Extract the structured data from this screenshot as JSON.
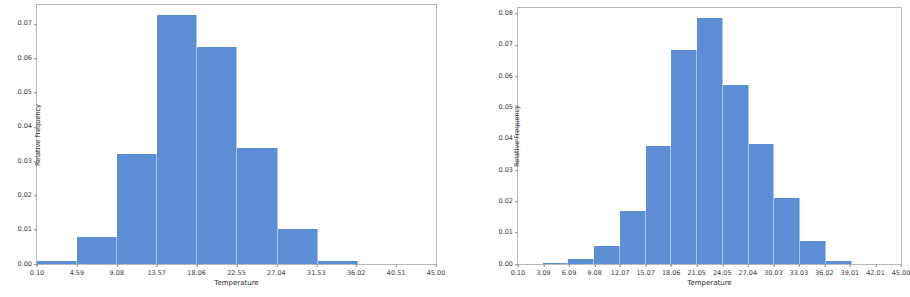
{
  "figure": {
    "background_color": "#ffffff",
    "bar_color": "#5b8ed4",
    "bar_edge_color": "#a8c4e8",
    "axis_color": "#b9b9b9"
  },
  "chart_data": [
    {
      "type": "bar",
      "title": "",
      "xlabel": "Temperature",
      "ylabel": "Relative Frequency",
      "xlim": [
        0.1,
        45.0
      ],
      "ylim": [
        0.0,
        0.0755
      ],
      "grid": false,
      "legend": null,
      "xticks": [
        "0.10",
        "4.59",
        "9.08",
        "13.57",
        "18.06",
        "22.55",
        "27.04",
        "31.53",
        "36.02",
        "40.51",
        "45.00"
      ],
      "yticks": [
        "0.00",
        "0.01",
        "0.02",
        "0.03",
        "0.04",
        "0.05",
        "0.06",
        "0.07"
      ],
      "bin_edges": [
        0.1,
        4.59,
        9.08,
        13.57,
        18.06,
        22.55,
        27.04,
        31.53,
        36.02,
        40.51,
        45.0
      ],
      "categories": [
        "0.10-4.59",
        "4.59-9.08",
        "9.08-13.57",
        "13.57-18.06",
        "18.06-22.55",
        "22.55-27.04",
        "27.04-31.53",
        "31.53-36.02",
        "36.02-40.51",
        "40.51-45.00"
      ],
      "values": [
        0.0008,
        0.008,
        0.0322,
        0.0725,
        0.0632,
        0.0339,
        0.0101,
        0.0008,
        0.0,
        0.0
      ]
    },
    {
      "type": "bar",
      "title": "",
      "xlabel": "Temperature",
      "ylabel": "Relative Frequency",
      "xlim": [
        0.1,
        45.0
      ],
      "ylim": [
        0.0,
        0.0818
      ],
      "grid": false,
      "legend": null,
      "xticks": [
        "0.10",
        "3.09",
        "6.09",
        "9.08",
        "12.07",
        "15.07",
        "18.06",
        "21.05",
        "24.05",
        "27.04",
        "30.03",
        "33.03",
        "36.02",
        "39.01",
        "42.01",
        "45.00"
      ],
      "yticks": [
        "0.00",
        "0.01",
        "0.02",
        "0.03",
        "0.04",
        "0.05",
        "0.06",
        "0.07",
        "0.08"
      ],
      "bin_edges": [
        0.1,
        3.09,
        6.09,
        9.08,
        12.07,
        15.07,
        18.06,
        21.05,
        24.05,
        27.04,
        30.03,
        33.03,
        36.02,
        39.01,
        42.01,
        45.0
      ],
      "categories": [
        "0.10-3.09",
        "3.09-6.09",
        "6.09-9.08",
        "9.08-12.07",
        "12.07-15.07",
        "15.07-18.06",
        "18.06-21.05",
        "21.05-24.05",
        "24.05-27.04",
        "27.04-30.03",
        "30.03-33.03",
        "33.03-36.02",
        "36.02-39.01",
        "39.01-42.01",
        "42.01-45.00"
      ],
      "values": [
        0.0,
        0.0003,
        0.0017,
        0.0058,
        0.017,
        0.0377,
        0.0685,
        0.0785,
        0.0573,
        0.0383,
        0.0212,
        0.0073,
        0.0011,
        0.0,
        0.0
      ]
    }
  ]
}
